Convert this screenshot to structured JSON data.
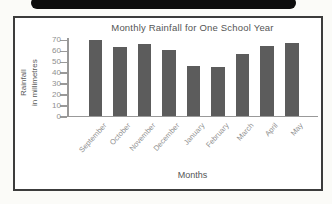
{
  "colors": {
    "bar_fill": "#5c5c5c",
    "axis": "#999999",
    "tick_label_text": "#8f8f8f",
    "title_text": "#555555",
    "frame_border": "#3c3c3c",
    "top_bar": "#0d0d0d",
    "background": "#ffffff"
  },
  "chart_data": {
    "type": "bar",
    "title": "Monthly Rainfall for One School Year",
    "xlabel": "Months",
    "ylabel": "Rainfall in millimetres",
    "ylabel_lines": [
      "Rainfall",
      "in millimetres"
    ],
    "categories": [
      "September",
      "October",
      "November",
      "December",
      "January",
      "February",
      "March",
      "April",
      "May"
    ],
    "values": [
      70,
      63,
      66,
      61,
      46,
      45,
      57,
      64,
      67
    ],
    "yticks": [
      0,
      10,
      20,
      30,
      40,
      50,
      60,
      70
    ],
    "ylim": [
      0,
      73
    ],
    "grid": false,
    "legend": null,
    "bar_color": "#5c5c5c"
  }
}
